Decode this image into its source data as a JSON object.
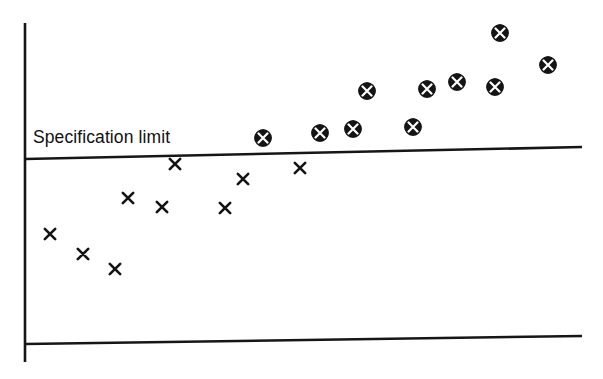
{
  "chart_data": {
    "type": "scatter",
    "title": "",
    "subtitle": "",
    "xlabel": "",
    "ylabel": "",
    "xlim": [
      0,
      603
    ],
    "ylim": [
      0,
      379
    ],
    "grid": false,
    "legend_position": "none",
    "annotations": [
      {
        "name": "specification-limit-label",
        "text": "Specification limit",
        "x": 33,
        "y": 128
      }
    ],
    "reference_lines": [
      {
        "name": "specification-limit-line",
        "label": "Specification limit",
        "x1": 25,
        "y1": 159,
        "x2": 582,
        "y2": 147,
        "color": "#161616",
        "width": 2.6
      },
      {
        "name": "baseline-line",
        "label": "",
        "x1": 25,
        "y1": 344,
        "x2": 582,
        "y2": 336,
        "color": "#161616",
        "width": 2.6
      }
    ],
    "axes": [
      {
        "name": "vertical-axis",
        "x1": 25,
        "y1": 23,
        "x2": 25,
        "y2": 362,
        "color": "#161616",
        "width": 2.6
      }
    ],
    "series": [
      {
        "name": "within-specification",
        "marker": "x",
        "marker_label": "x",
        "color": "#141414",
        "count": 9,
        "points": [
          {
            "x": 50,
            "y": 234
          },
          {
            "x": 83,
            "y": 254
          },
          {
            "x": 115,
            "y": 269
          },
          {
            "x": 128,
            "y": 198
          },
          {
            "x": 162,
            "y": 207
          },
          {
            "x": 175,
            "y": 164
          },
          {
            "x": 225,
            "y": 208
          },
          {
            "x": 243,
            "y": 179
          },
          {
            "x": 300,
            "y": 168
          }
        ]
      },
      {
        "name": "out-of-specification",
        "marker": "circled-x",
        "marker_label": "circled x",
        "color": "#151515",
        "count": 10,
        "points": [
          {
            "x": 263,
            "y": 138
          },
          {
            "x": 320,
            "y": 133
          },
          {
            "x": 353,
            "y": 129
          },
          {
            "x": 367,
            "y": 91
          },
          {
            "x": 413,
            "y": 127
          },
          {
            "x": 427,
            "y": 89
          },
          {
            "x": 457,
            "y": 82
          },
          {
            "x": 495,
            "y": 87
          },
          {
            "x": 500,
            "y": 33
          },
          {
            "x": 548,
            "y": 65
          }
        ]
      }
    ]
  },
  "colors": {
    "background": "#ffffff",
    "ink": "#161616",
    "marker_fill": "#151515",
    "marker_cross": "#ffffff"
  }
}
